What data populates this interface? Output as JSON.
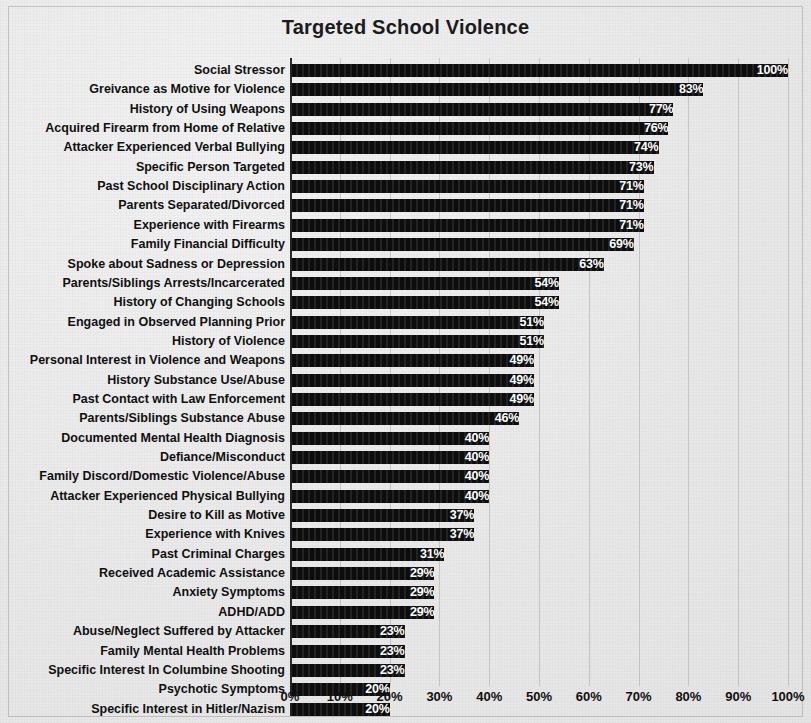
{
  "chart_data": {
    "type": "bar",
    "orientation": "horizontal",
    "title": "Targeted School Violence",
    "xlabel": "",
    "ylabel": "",
    "xlim": [
      0,
      100
    ],
    "grid": true,
    "legend": null,
    "value_suffix": "%",
    "x_ticks": [
      "0%",
      "10%",
      "20%",
      "30%",
      "40%",
      "50%",
      "60%",
      "70%",
      "80%",
      "90%",
      "100%"
    ],
    "x_tick_values": [
      0,
      10,
      20,
      30,
      40,
      50,
      60,
      70,
      80,
      90,
      100
    ],
    "categories": [
      "Social Stressor",
      "Greivance as Motive for Violence",
      "History of Using Weapons",
      "Acquired Firearm from Home of Relative",
      "Attacker Experienced Verbal Bullying",
      "Specific Person Targeted",
      "Past School Disciplinary Action",
      "Parents Separated/Divorced",
      "Experience with Firearms",
      "Family Financial Difficulty",
      "Spoke about Sadness or Depression",
      "Parents/Siblings Arrests/Incarcerated",
      "History of Changing Schools",
      "Engaged in Observed Planning Prior",
      "History of Violence",
      "Personal Interest in Violence and Weapons",
      "History Substance Use/Abuse",
      "Past Contact with Law Enforcement",
      "Parents/Siblings Substance Abuse",
      "Documented Mental Health Diagnosis",
      "Defiance/Misconduct",
      "Family Discord/Domestic Violence/Abuse",
      "Attacker Experienced Physical Bullying",
      "Desire to Kill as Motive",
      "Experience with Knives",
      "Past Criminal Charges",
      "Received Academic Assistance",
      "Anxiety Symptoms",
      "ADHD/ADD",
      "Abuse/Neglect Suffered by Attacker",
      "Family Mental Health Problems",
      "Specific Interest In Columbine Shooting",
      "Psychotic Symptoms",
      "Specific Interest in Hitler/Nazism"
    ],
    "values": [
      100,
      83,
      77,
      76,
      74,
      73,
      71,
      71,
      71,
      69,
      63,
      54,
      54,
      51,
      51,
      49,
      49,
      49,
      46,
      40,
      40,
      40,
      40,
      37,
      37,
      31,
      29,
      29,
      29,
      23,
      23,
      23,
      20,
      20
    ],
    "value_labels": [
      "100%",
      "83%",
      "77%",
      "76%",
      "74%",
      "73%",
      "71%",
      "71%",
      "71%",
      "69%",
      "63%",
      "54%",
      "54%",
      "51%",
      "51%",
      "49%",
      "49%",
      "49%",
      "46%",
      "40%",
      "40%",
      "40%",
      "40%",
      "37%",
      "37%",
      "31%",
      "29%",
      "29%",
      "29%",
      "23%",
      "23%",
      "23%",
      "20%",
      "20%"
    ],
    "colors": {
      "bar": "#0d0d0d",
      "value_label": "#ffffff",
      "background": "#ececec",
      "text": "#101010",
      "gridline": "#8c8c8c",
      "axis": "#2a2a2a"
    }
  }
}
